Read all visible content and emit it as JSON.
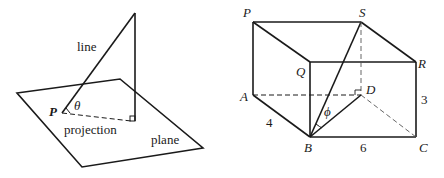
{
  "left_figure": {
    "labels": {
      "line": "line",
      "point": "P",
      "angle": "θ",
      "projection": "projection",
      "plane": "plane"
    }
  },
  "right_figure": {
    "vertices": {
      "P": "P",
      "S": "S",
      "Q": "Q",
      "R": "R",
      "A": "A",
      "D": "D",
      "B": "B",
      "C": "C"
    },
    "angle": "ϕ",
    "dimensions": {
      "AB": "4",
      "BC": "6",
      "RC": "3"
    }
  }
}
